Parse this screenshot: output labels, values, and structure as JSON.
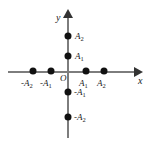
{
  "figure": {
    "background_color": "#ffffff",
    "axis_color": "#7d7d7d",
    "point_color": "#111111",
    "text_color": "#1a1a1a",
    "width": 149,
    "height": 143
  },
  "axes": {
    "x_label": "x",
    "y_label": "y",
    "origin_label": "O"
  },
  "chart_data": {
    "type": "scatter",
    "title": "",
    "xlabel": "x",
    "ylabel": "y",
    "grid": false,
    "legend": false,
    "origin_label": "O",
    "xlim": [
      -2.6,
      2.8
    ],
    "ylim": [
      -2.6,
      2.8
    ],
    "points": [
      {
        "id": "x-neg-a2",
        "label": "-A",
        "sub": "2",
        "x": -2,
        "y": 0,
        "px": 33,
        "py": 71,
        "label_px": 21,
        "label_py": 79
      },
      {
        "id": "x-neg-a1",
        "label": "-A",
        "sub": "1",
        "x": -1,
        "y": 0,
        "px": 51,
        "py": 71,
        "label_px": 40,
        "label_py": 79
      },
      {
        "id": "x-pos-a1",
        "label": "A",
        "sub": "1",
        "x": 1,
        "y": 0,
        "px": 86,
        "py": 71,
        "label_px": 79,
        "label_py": 79
      },
      {
        "id": "x-pos-a2",
        "label": "A",
        "sub": "2",
        "x": 2,
        "y": 0,
        "px": 104,
        "py": 71,
        "label_px": 97,
        "label_py": 79
      },
      {
        "id": "y-pos-a2",
        "label": "A",
        "sub": "2",
        "x": 0,
        "y": 2,
        "px": 68,
        "py": 36,
        "label_px": 75,
        "label_py": 32
      },
      {
        "id": "y-pos-a1",
        "label": "A",
        "sub": "1",
        "x": 0,
        "y": 1,
        "px": 68,
        "py": 56,
        "label_px": 75,
        "label_py": 52
      },
      {
        "id": "y-neg-a1",
        "label": "-A",
        "sub": "1",
        "x": 0,
        "y": -1,
        "px": 68,
        "py": 92,
        "label_px": 74,
        "label_py": 88
      },
      {
        "id": "y-neg-a2",
        "label": "-A",
        "sub": "2",
        "x": 0,
        "y": -2,
        "px": 68,
        "py": 117,
        "label_px": 74,
        "label_py": 113
      }
    ]
  }
}
